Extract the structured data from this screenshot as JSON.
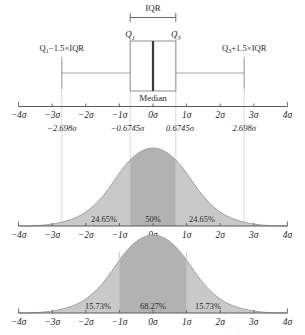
{
  "figure": {
    "caption": ""
  },
  "axis": {
    "ticks": [
      {
        "value": -4,
        "label": "−4σ"
      },
      {
        "value": -3,
        "label": "−3σ"
      },
      {
        "value": -2,
        "label": "−2σ"
      },
      {
        "value": -1,
        "label": "−1σ"
      },
      {
        "value": 0,
        "label": "0σ"
      },
      {
        "value": 1,
        "label": "1σ"
      },
      {
        "value": 2,
        "label": "2σ"
      },
      {
        "value": 3,
        "label": "3σ"
      },
      {
        "value": 4,
        "label": "4σ"
      }
    ],
    "range": [
      -4,
      4
    ],
    "unit": "σ"
  },
  "annotations": {
    "lower_fence_value": "−2.698σ",
    "q1_value": "−0.6745σ",
    "q3_value": "0.6745σ",
    "upper_fence_value": "2.698σ"
  },
  "boxplot": {
    "iqr_label": "IQR",
    "q1_label": "Q",
    "q1_sub": "1",
    "q3_label": "Q",
    "q3_sub": "3",
    "median_label": "Median",
    "lower_whisker_label": "Q₁−1.5×IQR",
    "lower_whisker_parts": {
      "q": "Q",
      "sub": "1",
      "rest": "−1.5×IQR"
    },
    "upper_whisker_parts": {
      "q": "Q",
      "sub": "3",
      "rest": "+1.5×IQR"
    },
    "q1": -0.6745,
    "q3": 0.6745,
    "median": 0,
    "lower_fence": -2.698,
    "upper_fence": 2.698
  },
  "curves": [
    {
      "name": "quartile-curve",
      "shaded_regions": [
        {
          "from": -2.698,
          "to": -0.6745,
          "label": "24.65%",
          "shade": "light"
        },
        {
          "from": -0.6745,
          "to": 0.6745,
          "label": "50%",
          "shade": "dark"
        },
        {
          "from": 0.6745,
          "to": 2.698,
          "label": "24.65%",
          "shade": "light"
        }
      ],
      "labels": [
        "24.65%",
        "50%",
        "24.65%"
      ]
    },
    {
      "name": "sigma-curve",
      "shaded_regions": [
        {
          "from": -3,
          "to": -1,
          "label": "15.73%",
          "shade": "light"
        },
        {
          "from": -1,
          "to": 1,
          "label": "68.27%",
          "shade": "dark"
        },
        {
          "from": 1,
          "to": 3,
          "label": "15.73%",
          "shade": "light"
        }
      ],
      "labels": [
        "15.73%",
        "68.27%",
        "15.73%"
      ]
    }
  ],
  "colors": {
    "shade_dark": "#b2b2b2",
    "shade_light": "#c9c9c9",
    "line": "#5a5a5a",
    "guide": "#cfcfcf",
    "text": "#2a2a2a",
    "curve_outline": "#9a9a9a"
  }
}
